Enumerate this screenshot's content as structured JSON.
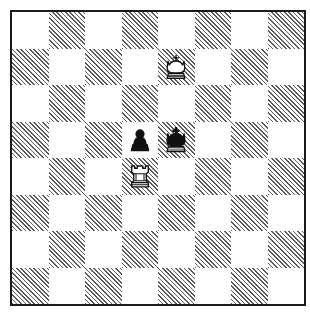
{
  "diagram": {
    "kind": "chess-position-diagram",
    "board": {
      "files": [
        "a",
        "b",
        "c",
        "d",
        "e",
        "f",
        "g",
        "h"
      ],
      "ranks": [
        "8",
        "7",
        "6",
        "5",
        "4",
        "3",
        "2",
        "1"
      ],
      "square_count": 64,
      "light_square_color": "#ffffff",
      "dark_square_color": "#5a5a5a",
      "dark_square_style": "diagonal-hatch",
      "border_color": "#1a1a1a",
      "coordinates_shown": false,
      "orientation": "white-bottom"
    },
    "pieces": [
      {
        "name": "white-king",
        "symbol": "K",
        "color": "white",
        "square": "e7",
        "file_index": 4,
        "rank_index": 1,
        "square_shade": "dark"
      },
      {
        "name": "black-pawn",
        "symbol": "p",
        "color": "black",
        "square": "d5",
        "file_index": 3,
        "rank_index": 3,
        "square_shade": "light"
      },
      {
        "name": "black-king",
        "symbol": "k",
        "color": "black",
        "square": "e5",
        "file_index": 4,
        "rank_index": 3,
        "square_shade": "dark"
      },
      {
        "name": "white-rook",
        "symbol": "R",
        "color": "white",
        "square": "d4",
        "file_index": 3,
        "rank_index": 4,
        "square_shade": "dark"
      }
    ],
    "fen": "8/4K3/8/3pk3/3R4/8/8/8",
    "piece_count": 4
  }
}
